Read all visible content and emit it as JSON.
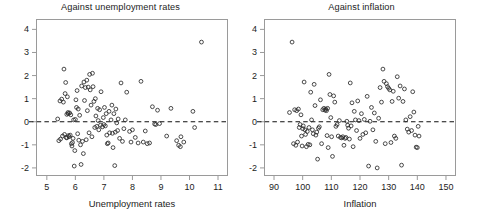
{
  "figure": {
    "width": 482,
    "height": 217,
    "background": "#ffffff",
    "point_color": "#2a2a2a",
    "axis_color": "#9a9a9a",
    "zero_line_color": "#111111"
  },
  "chart_data": [
    {
      "type": "scatter",
      "panel": "left",
      "title": "Against unemployment rates",
      "xlabel": "Unemployment rates",
      "ylabel": "",
      "xlim": [
        4.62,
        11.35
      ],
      "ylim": [
        -2.35,
        4.45
      ],
      "xticks": [
        5,
        6,
        7,
        8,
        9,
        10,
        11
      ],
      "yticks": [
        4,
        3,
        2,
        1,
        0,
        -1,
        -2
      ],
      "xticklabels": [
        "5",
        "6",
        "7",
        "8",
        "9",
        "10",
        "11"
      ],
      "yticklabels": [
        "4",
        "3",
        "2",
        "1",
        "0",
        "-1",
        "-2"
      ],
      "grid": false,
      "legend": null,
      "annotations": [
        {
          "type": "hline",
          "y": 0,
          "style": "dashed"
        }
      ],
      "marker": "open-circle",
      "x": [
        5.38,
        5.42,
        5.46,
        5.48,
        5.52,
        5.55,
        5.58,
        5.6,
        5.62,
        5.64,
        5.66,
        5.68,
        5.7,
        5.7,
        5.72,
        5.74,
        5.75,
        5.76,
        5.78,
        5.8,
        5.82,
        5.84,
        5.86,
        5.88,
        5.9,
        5.92,
        5.94,
        5.96,
        5.98,
        6.0,
        6.02,
        6.04,
        6.06,
        6.08,
        6.1,
        6.12,
        6.15,
        6.18,
        6.2,
        6.22,
        6.25,
        6.28,
        6.3,
        6.32,
        6.35,
        6.38,
        6.4,
        6.42,
        6.45,
        6.48,
        6.5,
        6.52,
        6.55,
        6.58,
        6.6,
        6.62,
        6.65,
        6.68,
        6.7,
        6.72,
        6.75,
        6.78,
        6.8,
        6.82,
        6.85,
        6.88,
        6.9,
        6.95,
        6.98,
        7.0,
        7.02,
        7.05,
        7.08,
        7.1,
        7.12,
        7.15,
        7.18,
        7.2,
        7.25,
        7.28,
        7.3,
        7.32,
        7.35,
        7.38,
        7.4,
        7.42,
        7.45,
        7.48,
        7.5,
        7.55,
        7.6,
        7.65,
        7.7,
        7.75,
        7.8,
        7.9,
        7.95,
        8.0,
        8.1,
        8.2,
        8.3,
        8.38,
        8.45,
        8.52,
        8.6,
        8.7,
        8.78,
        8.82,
        8.88,
        8.95,
        9.2,
        9.35,
        9.55,
        9.62,
        9.68,
        9.7,
        9.8,
        10.12,
        10.18,
        10.42
      ],
      "y": [
        0.12,
        -0.82,
        0.9,
        -0.75,
        0.98,
        -0.62,
        0.85,
        2.28,
        -0.55,
        1.22,
        1.7,
        -0.68,
        0.32,
        -0.7,
        1.08,
        0.4,
        0.35,
        -0.6,
        -0.65,
        0.38,
        -0.58,
        0.3,
        -0.95,
        -1.05,
        -0.9,
        -0.72,
        0.08,
        -1.92,
        -1.25,
        0.1,
        0.95,
        0.62,
        1.35,
        -0.52,
        0.55,
        -0.8,
        0.28,
        -1.0,
        -1.85,
        1.55,
        -0.85,
        -1.38,
        1.72,
        0.92,
        1.48,
        -0.78,
        1.8,
        0.48,
        1.5,
        -0.48,
        2.05,
        1.38,
        0.72,
        -0.65,
        2.1,
        1.52,
        0.88,
        -0.25,
        1.0,
        0.25,
        -0.2,
        0.58,
        0.05,
        -0.35,
        0.52,
        -0.15,
        1.3,
        -0.22,
        0.18,
        -0.12,
        0.62,
        -0.18,
        0.35,
        -0.58,
        -0.95,
        -0.92,
        0.45,
        -0.48,
        0.08,
        0.72,
        -0.5,
        -1.12,
        0.35,
        -1.9,
        -0.45,
        0.55,
        -0.05,
        -0.38,
        0.12,
        -0.72,
        1.68,
        -0.85,
        -0.3,
        0.08,
        1.28,
        -0.42,
        -0.88,
        -0.35,
        -0.68,
        -0.92,
        1.75,
        -0.88,
        -0.4,
        -0.95,
        -0.92,
        0.65,
        -0.1,
        -0.12,
        0.5,
        -0.08,
        -0.62,
        0.58,
        -0.82,
        -1.02,
        -1.08,
        -0.65,
        -0.88,
        0.45,
        -0.25,
        3.45
      ]
    },
    {
      "type": "scatter",
      "panel": "right",
      "title": "Against inflation",
      "xlabel": "Inflation",
      "ylabel": "",
      "xlim": [
        86.5,
        153.5
      ],
      "ylim": [
        -2.35,
        4.45
      ],
      "xticks": [
        90,
        100,
        110,
        120,
        130,
        140,
        150
      ],
      "yticks": [
        4,
        3,
        2,
        1,
        0,
        -1,
        -2
      ],
      "xticklabels": [
        "90",
        "100",
        "110",
        "120",
        "130",
        "140",
        "150"
      ],
      "yticklabels": [
        "4",
        "3",
        "2",
        "1",
        "0",
        "-1",
        "-2"
      ],
      "grid": false,
      "legend": null,
      "annotations": [
        {
          "type": "hline",
          "y": 0,
          "style": "dashed"
        }
      ],
      "marker": "open-circle",
      "x": [
        95.4,
        96.3,
        96.8,
        97.2,
        97.6,
        97.9,
        98.2,
        98.5,
        98.8,
        99.1,
        99.4,
        99.6,
        99.8,
        100.0,
        100.2,
        100.5,
        100.8,
        101.0,
        101.3,
        101.6,
        101.9,
        102.2,
        102.5,
        102.8,
        103.1,
        103.4,
        103.7,
        104.0,
        104.3,
        104.6,
        104.9,
        105.2,
        105.5,
        105.8,
        106.2,
        106.6,
        107.0,
        107.4,
        107.8,
        108.1,
        108.3,
        108.5,
        108.7,
        108.9,
        109.2,
        109.5,
        109.8,
        110.1,
        110.4,
        110.8,
        111.2,
        111.6,
        112.0,
        112.4,
        112.8,
        113.2,
        113.6,
        114.0,
        114.4,
        114.8,
        115.1,
        115.4,
        115.7,
        116.0,
        116.3,
        116.6,
        116.9,
        117.2,
        117.6,
        118.0,
        118.4,
        118.8,
        119.2,
        119.6,
        120.0,
        120.5,
        121.0,
        121.5,
        122.0,
        122.5,
        123.0,
        123.5,
        124.0,
        124.5,
        125.0,
        125.5,
        126.0,
        126.5,
        127.0,
        127.5,
        128.0,
        128.4,
        128.8,
        129.2,
        129.6,
        130.0,
        130.4,
        130.8,
        131.2,
        131.6,
        132.0,
        132.5,
        133.0,
        133.5,
        134.0,
        134.5,
        135.0,
        135.5,
        136.0,
        136.5,
        137.0,
        137.5,
        138.0,
        138.4,
        138.8,
        139.2,
        139.6,
        140.0,
        140.3,
        140.6
      ],
      "y": [
        0.4,
        3.45,
        -0.95,
        0.52,
        -1.02,
        0.48,
        -0.88,
        0.55,
        -0.25,
        -0.12,
        0.3,
        -0.62,
        -1.05,
        -0.3,
        -0.18,
        1.72,
        -0.35,
        -0.55,
        -1.08,
        -0.42,
        -0.98,
        -0.25,
        -1.0,
        1.28,
        0.08,
        -0.35,
        -0.52,
        1.62,
        0.7,
        -0.58,
        -0.45,
        -1.62,
        -0.28,
        -0.22,
        0.95,
        -0.95,
        0.52,
        0.58,
        0.5,
        0.55,
        0.48,
        -0.6,
        0.58,
        -1.12,
        2.05,
        1.18,
        0.18,
        -0.65,
        -1.5,
        1.12,
        0.85,
        -0.2,
        -0.12,
        -0.62,
        0.05,
        -0.68,
        -0.7,
        -0.65,
        -1.02,
        -0.72,
        -0.68,
        0.02,
        -0.15,
        -0.28,
        -0.75,
        1.68,
        -0.18,
        0.82,
        -1.08,
        0.45,
        0.08,
        -0.38,
        0.9,
        0.05,
        -0.72,
        0.35,
        -0.55,
        0.1,
        -0.48,
        1.1,
        -1.92,
        0.02,
        0.62,
        -0.35,
        0.38,
        -0.85,
        -2.0,
        0.15,
        1.48,
        0.85,
        2.28,
        1.75,
        -0.95,
        1.65,
        1.52,
        1.45,
        1.38,
        -0.9,
        0.88,
        1.32,
        -0.62,
        -0.72,
        1.95,
        1.02,
        1.55,
        -1.88,
        0.88,
        1.42,
        0.08,
        -0.32,
        -0.45,
        0.22,
        -0.38,
        1.3,
        0.42,
        -0.58,
        -1.1,
        -1.12,
        -0.2,
        -0.62
      ]
    }
  ]
}
